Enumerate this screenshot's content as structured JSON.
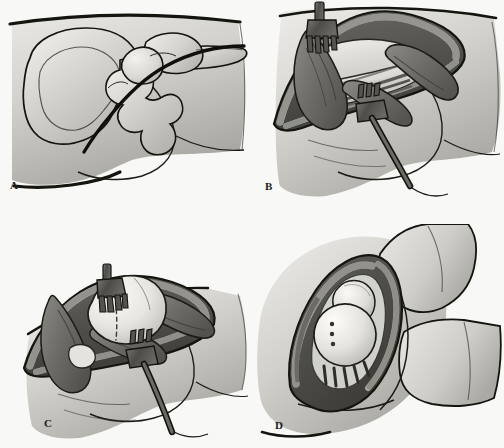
{
  "figure": {
    "modality": "line-and-wash medical illustration",
    "palette": {
      "background": "#f8f8f6",
      "skin_light": "#e6e5e1",
      "skin_mid": "#c9c8c3",
      "skin_shadow": "#9b9a95",
      "bone_light": "#efeeea",
      "bone_mid": "#cfcec9",
      "muscle_dark": "#6e6d68",
      "muscle_mid": "#8d8c86",
      "fat_speckle": "#b5b4ae",
      "wound_deep": "#4a4945",
      "instrument": "#555450",
      "outline": "#15150f"
    },
    "panel_count": 4,
    "layout": "2x2 grid"
  },
  "panels": [
    {
      "id": "A",
      "label": "A",
      "caption": "Lateral view of pelvis and proximal femur with skin incision marked",
      "structures": [
        "iliac wing",
        "anterior superior iliac spine",
        "acetabulum",
        "femoral head",
        "greater trochanter",
        "proximal femoral shaft",
        "ischium",
        "thigh contour",
        "buttock contour"
      ],
      "markings": [
        "curved posterolateral skin incision line"
      ]
    },
    {
      "id": "B",
      "label": "B",
      "caption": "Superficial dissection: fascia lata and gluteus maximus split, wound held open by rake retractors",
      "structures": [
        "skin edge",
        "subcutaneous fat layer",
        "fascia lata",
        "gluteus maximus fibers",
        "short external rotators",
        "vastus lateralis"
      ],
      "instruments": [
        {
          "name": "rake-retractor-superior",
          "prongs": 4,
          "position": "top of wound"
        },
        {
          "name": "rake-retractor-inferior",
          "prongs": 3,
          "position": "lower right of wound"
        }
      ]
    },
    {
      "id": "C",
      "label": "C",
      "caption": "Capsulotomy completed; femoral head exposed with dashed osteotomy line on femoral neck",
      "structures": [
        "hip joint capsule",
        "femoral head",
        "femoral neck",
        "greater trochanter",
        "short external rotators retracted",
        "lesser trochanter"
      ],
      "markings": [
        "dashed femoral neck osteotomy line"
      ],
      "instruments": [
        {
          "name": "rake-retractor-superior",
          "prongs": 4,
          "position": "top of wound"
        },
        {
          "name": "rake-retractor-inferior",
          "prongs": 3,
          "position": "lower center of wound"
        }
      ]
    },
    {
      "id": "D",
      "label": "D",
      "caption": "Hip flexed and internally rotated; prosthetic femoral head and acetabular component seated in the wound",
      "structures": [
        "flexed thigh",
        "lower leg",
        "wound edge",
        "acetabular component",
        "prosthetic femoral head",
        "femoral neck region",
        "capsule remnant"
      ],
      "markings": [
        "suture dots along implant rim"
      ]
    }
  ],
  "labels": {
    "a": "A",
    "b": "B",
    "c": "C",
    "d": "D"
  }
}
